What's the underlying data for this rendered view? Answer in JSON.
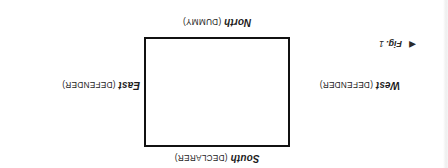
{
  "figure": {
    "rotation_note": "180",
    "caption": {
      "arrow_icon": "left-triangle-icon",
      "arrow_glyph": "◀",
      "label": "Fig.",
      "number": "1"
    },
    "table": {
      "shape": "rectangle",
      "border_color": "#111111",
      "fill_color": "#ffffff"
    },
    "positions": [
      {
        "id": "south",
        "direction": "South",
        "role": "(DECLARER)"
      },
      {
        "id": "west",
        "direction": "West",
        "role": "(DEFENDER)"
      },
      {
        "id": "east",
        "direction": "East",
        "role": "(DEFENDER)"
      },
      {
        "id": "north",
        "direction": "North",
        "role": "(DUMMY)"
      }
    ]
  }
}
